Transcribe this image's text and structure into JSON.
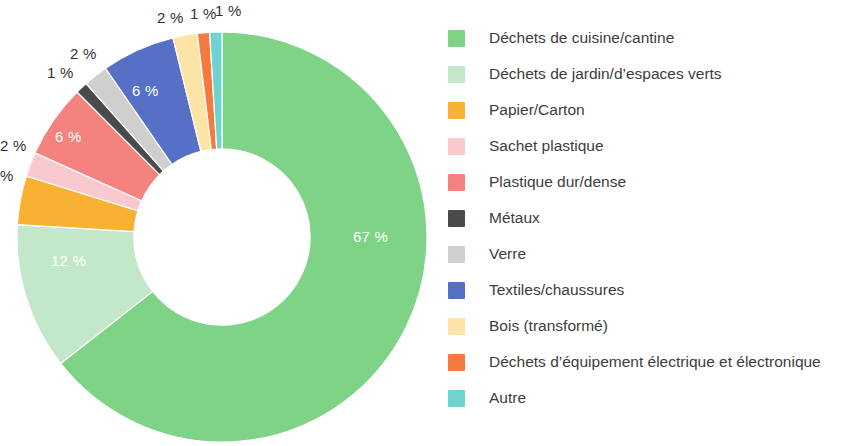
{
  "chart_data": {
    "type": "pie",
    "variant": "donut",
    "title": "",
    "subtitle": "",
    "xlabel": "",
    "ylabel": "",
    "grid": false,
    "legend_position": "right",
    "start_angle_deg": 0,
    "direction": "clockwise",
    "inner_radius_ratio": 0.43,
    "value_suffix": " %",
    "categories": [
      "Déchets de cuisine/cantine",
      "Déchets de jardin/d’espaces verts",
      "Papier/Carton",
      "Sachet plastique",
      "Plastique dur/dense",
      "Métaux",
      "Verre",
      "Textiles/chaussures",
      "Bois (transformé)",
      "Déchets d’équipement électrique et électronique",
      "Autre"
    ],
    "values": [
      67,
      12,
      4,
      2,
      6,
      1,
      2,
      6,
      2,
      1,
      1
    ],
    "colors": [
      "#7ED387",
      "#C2E8C9",
      "#F8B133",
      "#F9C9CE",
      "#F4827F",
      "#4A4A4A",
      "#CFCFCF",
      "#5570C4",
      "#FCE4A6",
      "#F47A3E",
      "#6FD4D1"
    ],
    "labels": [
      {
        "text": "67 %",
        "placement": "inside",
        "left": 353,
        "top": 229
      },
      {
        "text": "12 %",
        "placement": "inside",
        "left": 51,
        "top": 253
      },
      {
        "text": "%",
        "placement": "outside",
        "left": 0,
        "top": 168,
        "clipped": true
      },
      {
        "text": "2 %",
        "placement": "outside",
        "left": 0,
        "top": 138,
        "clipped": true
      },
      {
        "text": "6 %",
        "placement": "inside",
        "left": 55,
        "top": 129
      },
      {
        "text": "1 %",
        "placement": "outside",
        "left": 47,
        "top": 65
      },
      {
        "text": "2 %",
        "placement": "outside",
        "left": 70,
        "top": 46
      },
      {
        "text": "6 %",
        "placement": "inside",
        "left": 132,
        "top": 83
      },
      {
        "text": "2 %",
        "placement": "outside",
        "left": 157,
        "top": 10
      },
      {
        "text": "1 %",
        "placement": "outside",
        "left": 190,
        "top": 6
      },
      {
        "text": "1 %",
        "placement": "outside",
        "left": 215,
        "top": 3
      }
    ]
  },
  "legend": {
    "items": [
      {
        "label": "Déchets de cuisine/cantine",
        "color": "#7ED387"
      },
      {
        "label": "Déchets de jardin/d’espaces verts",
        "color": "#C2E8C9"
      },
      {
        "label": "Papier/Carton",
        "color": "#F8B133"
      },
      {
        "label": "Sachet plastique",
        "color": "#F9C9CE"
      },
      {
        "label": "Plastique dur/dense",
        "color": "#F4827F"
      },
      {
        "label": "Métaux",
        "color": "#4A4A4A"
      },
      {
        "label": "Verre",
        "color": "#CFCFCF"
      },
      {
        "label": "Textiles/chaussures",
        "color": "#5570C4"
      },
      {
        "label": "Bois (transformé)",
        "color": "#FCE4A6"
      },
      {
        "label": "Déchets d’équipement électrique et électronique",
        "color": "#F47A3E"
      },
      {
        "label": "Autre",
        "color": "#6FD4D1"
      }
    ]
  }
}
